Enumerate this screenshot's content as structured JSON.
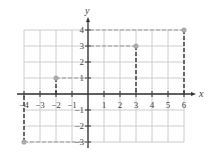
{
  "chart_data": {
    "type": "scatter",
    "title": "",
    "xlabel": "x",
    "ylabel": "y",
    "xlim": [
      -4,
      6
    ],
    "ylim": [
      -3,
      4
    ],
    "grid": true,
    "x_ticks": [
      "-4",
      "-3",
      "-2",
      "-1",
      "1",
      "2",
      "3",
      "4",
      "5",
      "6"
    ],
    "y_ticks": [
      "4",
      "3",
      "2",
      "1",
      "-1",
      "-2",
      "-3"
    ],
    "points": [
      {
        "x": -2,
        "y": 1
      },
      {
        "x": 3,
        "y": 3
      },
      {
        "x": 6,
        "y": 4
      },
      {
        "x": -4,
        "y": -3
      }
    ],
    "annotations": "Dashed projection lines from each point to both axes",
    "colors": {
      "grid": "#cccccc",
      "axis": "#333333",
      "point": "#aaaaaa",
      "dash": "#333333"
    }
  },
  "labels": {
    "x_axis": "x",
    "y_axis": "y"
  }
}
